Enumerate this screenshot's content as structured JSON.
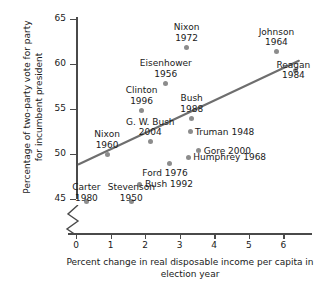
{
  "chart_data": {
    "type": "scatter",
    "title": "",
    "xlabel": "Percent change in real disposable income per capita in election year",
    "ylabel": "Percentage of two-party vote for party for incumbent president",
    "xlim": [
      0,
      6.8
    ],
    "ylim": [
      44.2,
      65
    ],
    "xticks": [
      0,
      1,
      2,
      3,
      4,
      5,
      6
    ],
    "yticks": [
      45,
      50,
      55,
      60,
      65
    ],
    "grid": false,
    "legend": false,
    "axis_break": "y-axis broken below 45",
    "point_color": "#8c8c8c",
    "trend_line": {
      "color": "#6e6e6e",
      "x": [
        0.08,
        6.45
      ],
      "y": [
        48.8,
        60.3
      ]
    },
    "points": [
      {
        "label": "Nixon\n1972",
        "x": 3.2,
        "y": 61.8
      },
      {
        "label": "Johnson\n1964",
        "x": 5.8,
        "y": 61.3
      },
      {
        "label": "Eisenhower\n1956",
        "x": 2.6,
        "y": 57.8
      },
      {
        "label": "Reagan\n1984",
        "x": 6.35,
        "y": 59.2
      },
      {
        "label": "Clinton\n1996",
        "x": 1.9,
        "y": 54.8
      },
      {
        "label": "Bush\n1988",
        "x": 3.35,
        "y": 53.9
      },
      {
        "label": "G. W. Bush\n2004",
        "x": 2.15,
        "y": 51.3
      },
      {
        "label": "Truman 1948",
        "x": 3.3,
        "y": 52.4
      },
      {
        "label": "Nixon\n1960",
        "x": 0.9,
        "y": 49.9
      },
      {
        "label": "Gore 2000",
        "x": 3.55,
        "y": 50.3
      },
      {
        "label": "Humphrey 1968",
        "x": 3.25,
        "y": 49.6
      },
      {
        "label": "Ford 1976",
        "x": 2.7,
        "y": 48.9
      },
      {
        "label": "Bush 1992",
        "x": 1.85,
        "y": 46.6
      },
      {
        "label": "Carter\n1980",
        "x": 0.3,
        "y": 44.7
      },
      {
        "label": "Stevenson\n1950",
        "x": 1.6,
        "y": 44.7
      }
    ]
  }
}
